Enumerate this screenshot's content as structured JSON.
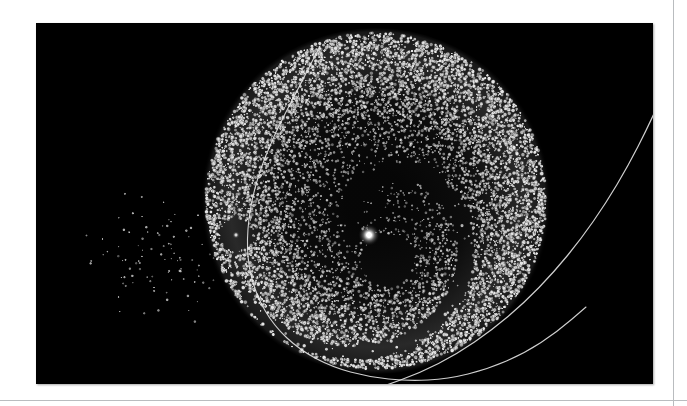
{
  "page": {
    "background_color": "#ffffff",
    "rules": [
      {
        "orientation": "vertical",
        "x": 673,
        "color": "#b9bcbf"
      },
      {
        "orientation": "horizontal",
        "y": 400,
        "color": "#b9bcbf"
      }
    ]
  },
  "figure": {
    "caption": "",
    "panel": {
      "x": 36,
      "y": 23,
      "width": 617,
      "height": 361,
      "background_color": "#000000"
    }
  },
  "chart_data": {
    "type": "scatter",
    "title": "",
    "subtitle": "",
    "xlabel": "",
    "ylabel": "",
    "grid": false,
    "legend": null,
    "colormap": "grayscale",
    "background_color": "#000000",
    "axis_visible": false,
    "tick_labels_x": [],
    "tick_labels_y": [],
    "xlim": [
      0,
      617
    ],
    "ylim": [
      0,
      361
    ],
    "series": [
      {
        "name": "particle-cloud",
        "kind": "point-cloud",
        "count": 9000,
        "center": [
          340,
          178
        ],
        "radius_x": 170,
        "radius_y": 168,
        "edge_brightness": 0.95,
        "core_brightness": 0.35,
        "point_color": "#e8e8e8",
        "point_size_px": [
          1.0,
          2.6
        ]
      },
      {
        "name": "ejected-tail",
        "kind": "point-cloud",
        "count": 95,
        "center": [
          120,
          235
        ],
        "extent_x": 130,
        "extent_y": 120,
        "point_color": "#dcdcdc",
        "point_size_px": [
          1.0,
          2.0
        ]
      },
      {
        "name": "central-source",
        "kind": "bright-point",
        "position": [
          333,
          212
        ],
        "brightness": 1.0,
        "color": "#ffffff",
        "halo_radius_px": 11
      },
      {
        "name": "secondary-void-core",
        "kind": "bright-point",
        "position": [
          200,
          212
        ],
        "brightness": 0.55,
        "color": "#d8d8d8",
        "halo_radius_px": 4
      }
    ],
    "voids": [
      {
        "name": "spiral-gap",
        "kind": "spiral-void",
        "center": [
          340,
          205
        ],
        "inner_radius": 14,
        "outer_radius": 150,
        "turns": 0.95,
        "start_angle_deg": 175,
        "width_deg": 58
      },
      {
        "name": "secondary-void",
        "kind": "circular-void",
        "center": [
          200,
          212
        ],
        "radius": 16
      },
      {
        "name": "inner-void",
        "kind": "circular-void",
        "center": [
          352,
          238
        ],
        "radius": 26
      }
    ],
    "trajectories": [
      {
        "name": "orbit-curve-primary",
        "color": "#e6e6e6",
        "width_px": 1.1,
        "points": [
          [
            284,
            23
          ],
          [
            260,
            70
          ],
          [
            238,
            112
          ],
          [
            221,
            155
          ],
          [
            212,
            196
          ],
          [
            211,
            236
          ],
          [
            220,
            272
          ],
          [
            238,
            303
          ],
          [
            264,
            327
          ],
          [
            296,
            344
          ],
          [
            333,
            354
          ],
          [
            372,
            358
          ],
          [
            412,
            356
          ],
          [
            452,
            346
          ],
          [
            489,
            330
          ],
          [
            521,
            309
          ],
          [
            550,
            284
          ]
        ]
      },
      {
        "name": "orbit-curve-secondary",
        "color": "#e6e6e6",
        "width_px": 1.2,
        "points": [
          [
            648,
            23
          ],
          [
            630,
            64
          ],
          [
            612,
            104
          ],
          [
            592,
            143
          ],
          [
            570,
            180
          ],
          [
            545,
            216
          ],
          [
            518,
            249
          ],
          [
            488,
            280
          ],
          [
            456,
            307
          ],
          [
            421,
            331
          ],
          [
            384,
            350
          ],
          [
            345,
            364
          ]
        ]
      }
    ]
  }
}
